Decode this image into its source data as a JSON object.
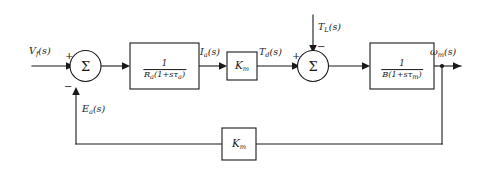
{
  "diagram": {
    "type": "control-system-block-diagram",
    "background_color": "#ffffff",
    "line_color": "#1a1a1a",
    "signals": {
      "input": "V",
      "input_sub": "f",
      "input_suffix": "(s)",
      "armature_current": "I",
      "armature_current_sub": "a",
      "armature_current_suffix": "(s)",
      "developed_torque": "T",
      "developed_torque_sub": "d",
      "developed_torque_suffix": "(s)",
      "load_torque": "T",
      "load_torque_sub": "L",
      "load_torque_suffix": "(s)",
      "output_speed": "ω",
      "output_speed_sub": "m",
      "output_speed_suffix": "(s)",
      "back_emf": "E",
      "back_emf_sub": "a",
      "back_emf_suffix": "(s)"
    },
    "summing_junctions": [
      {
        "id": "sum-1",
        "symbol": "Σ",
        "input_sign_left": "+",
        "input_sign_bottom": "−"
      },
      {
        "id": "sum-2",
        "symbol": "Σ",
        "input_sign_left": "+",
        "input_sign_top": "−"
      }
    ],
    "blocks": [
      {
        "id": "block-armature",
        "kind": "fraction",
        "numerator": "1",
        "denominator_base": "R",
        "denominator_sub": "a",
        "denominator_rest": "(1+sτ",
        "denominator_rest_sub": "a",
        "denominator_close": ")",
        "label_plain": "1 / Ra(1+sτa)"
      },
      {
        "id": "block-torque-constant",
        "kind": "gain",
        "gain_base": "K",
        "gain_sub": "m",
        "label_plain": "Km"
      },
      {
        "id": "block-mechanical",
        "kind": "fraction",
        "numerator": "1",
        "denominator_base": "B",
        "denominator_sub": "",
        "denominator_rest": "(1+sτ",
        "denominator_rest_sub": "m",
        "denominator_close": ")",
        "label_plain": "1 / B(1+sτm)"
      },
      {
        "id": "block-feedback-gain",
        "kind": "gain",
        "gain_base": "K",
        "gain_sub": "m",
        "label_plain": "Km"
      }
    ]
  }
}
